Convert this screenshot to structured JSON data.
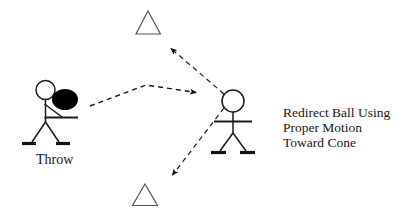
{
  "diagram": {
    "labels": {
      "throw": "Throw",
      "instruction_line1": "Redirect Ball Using",
      "instruction_line2": "Proper Motion",
      "instruction_line3": "Toward Cone"
    },
    "figures": [
      {
        "name": "thrower",
        "label": "Throw",
        "holds_ball": true,
        "position": {
          "x": 45,
          "y": 100
        }
      },
      {
        "name": "receiver",
        "label": "",
        "holds_ball": false,
        "position": {
          "x": 233,
          "y": 100
        }
      }
    ],
    "cones": [
      {
        "name": "top-cone",
        "apex": {
          "x": 148,
          "y": 11
        },
        "base_left": {
          "x": 137,
          "y": 34
        },
        "base_right": {
          "x": 160,
          "y": 34
        }
      },
      {
        "name": "bottom-cone",
        "apex": {
          "x": 145,
          "y": 184
        },
        "base_left": {
          "x": 133,
          "y": 205
        },
        "base_right": {
          "x": 157,
          "y": 205
        }
      }
    ],
    "arrows": [
      {
        "name": "throw-path-arrow",
        "from": {
          "x": 90,
          "y": 106
        },
        "via": {
          "x": 146,
          "y": 85
        },
        "to": {
          "x": 199,
          "y": 93
        },
        "style": "dashed"
      },
      {
        "name": "redirect-up-arrow",
        "from": {
          "x": 224,
          "y": 94
        },
        "to": {
          "x": 168,
          "y": 46
        },
        "style": "dashed"
      },
      {
        "name": "redirect-down-arrow",
        "from": {
          "x": 224,
          "y": 108
        },
        "to": {
          "x": 170,
          "y": 178
        },
        "style": "dashed"
      }
    ],
    "colors": {
      "stroke": "#1a1a1a",
      "ball_fill": "#000000",
      "cone_stroke": "#4a4a4a",
      "background": "#ffffff",
      "text": "#161616"
    }
  }
}
